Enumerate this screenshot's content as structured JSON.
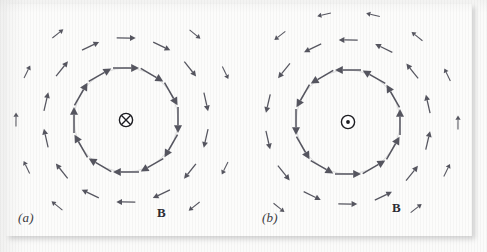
{
  "figure": {
    "background_color": "#fbfbfa",
    "arrow_color": "#55555f",
    "symbol_color": "#1d1d22",
    "width": 487,
    "height": 252
  },
  "panels": [
    {
      "id": "a",
      "caption": "(a)",
      "field_label": "B",
      "center_symbol": "circle-cross",
      "center_symbol_meaning": "current into page",
      "circulation": "clockwise",
      "center": {
        "x": 126,
        "y": 120
      },
      "guide_circle_radius": 52,
      "rings": [
        {
          "radius": 52,
          "arrow_length": 26,
          "count": 12,
          "start_angle": 0
        },
        {
          "radius": 82,
          "arrow_length": 19,
          "count": 14,
          "start_angle": 13
        },
        {
          "radius": 110,
          "arrow_length": 14,
          "count": 14,
          "start_angle": 26
        }
      ]
    },
    {
      "id": "b",
      "caption": "(b)",
      "field_label": "B",
      "center_symbol": "circle-dot",
      "center_symbol_meaning": "current out of page",
      "circulation": "counterclockwise",
      "center": {
        "x": 104,
        "y": 122
      },
      "guide_circle_radius": 52,
      "rings": [
        {
          "radius": 52,
          "arrow_length": 26,
          "count": 12,
          "start_angle": 0
        },
        {
          "radius": 82,
          "arrow_length": 19,
          "count": 14,
          "start_angle": 13
        },
        {
          "radius": 110,
          "arrow_length": 14,
          "count": 14,
          "start_angle": 26
        }
      ]
    }
  ]
}
